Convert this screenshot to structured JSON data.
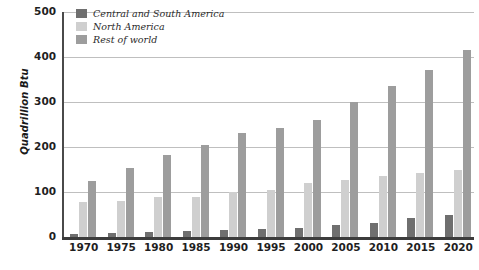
{
  "chart_data": {
    "type": "bar",
    "title": "",
    "subtitle": "",
    "xlabel": "",
    "ylabel": "Quadrillion Btu",
    "categories": [
      "1970",
      "1975",
      "1980",
      "1985",
      "1990",
      "1995",
      "2000",
      "2005",
      "2010",
      "2015",
      "2020"
    ],
    "series": [
      {
        "name": "Central and South America",
        "color": "#6f6f6f",
        "values": [
          7,
          8,
          12,
          13,
          15,
          18,
          21,
          27,
          32,
          42,
          48
        ]
      },
      {
        "name": "North America",
        "color": "#cfcfcf",
        "values": [
          77,
          81,
          90,
          89,
          100,
          105,
          120,
          126,
          135,
          142,
          148
        ]
      },
      {
        "name": "Rest of world",
        "color": "#9d9d9d",
        "values": [
          124,
          154,
          183,
          205,
          232,
          242,
          260,
          299,
          336,
          372,
          415
        ]
      }
    ],
    "ylim": [
      0,
      500
    ],
    "yticks": [
      0,
      100,
      200,
      300,
      400,
      500
    ],
    "ytick_labels": [
      "0",
      "100",
      "200",
      "300",
      "400",
      "500"
    ],
    "grid": true,
    "grid_axis": "y",
    "legend_position": "top-left",
    "legend": [
      "Central and South America",
      "North America",
      "Rest of world"
    ]
  },
  "colors": {
    "series_dark": "#6f6f6f",
    "series_light": "#cfcfcf",
    "series_medium": "#9d9d9d",
    "gridline": "#bfbfbf",
    "axis": "#3c3c3c",
    "text": "#1f1f1f",
    "background": "#ffffff"
  }
}
